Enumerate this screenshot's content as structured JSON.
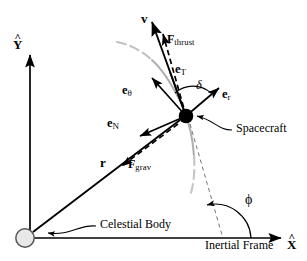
{
  "figure": {
    "type": "vector-diagram",
    "background_color": "#ffffff",
    "line_color": "#000000",
    "trajectory_color": "#b3b3b3",
    "body_fill_color": "#e6e6e6",
    "spacecraft_color": "#000000"
  },
  "axes": {
    "x_label": "X",
    "x_hat": "^",
    "y_label": "Y",
    "y_hat": "^",
    "frame_label": "Inertial Frame"
  },
  "objects": {
    "celestial_body_label": "Celestial Body",
    "spacecraft_label": "Spacecraft"
  },
  "vectors": {
    "velocity": "v",
    "position": "r",
    "thrust_force": "F",
    "thrust_force_sub": "thrust",
    "gravity_force": "F",
    "gravity_force_sub": "grav",
    "e_tangential": "e",
    "e_tangential_sub": "T",
    "e_normal": "e",
    "e_normal_sub": "N",
    "e_radial": "e",
    "e_radial_sub": "r",
    "e_theta": "e",
    "e_theta_sub": "θ"
  },
  "angles": {
    "delta": "δ",
    "phi": "ϕ"
  }
}
